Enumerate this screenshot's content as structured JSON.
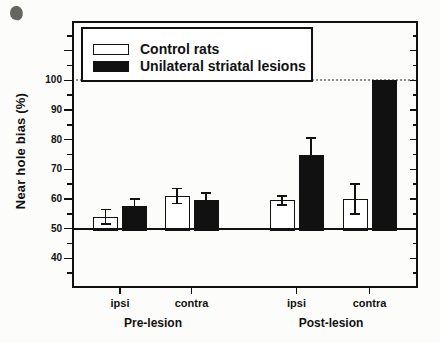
{
  "figure": {
    "background": "#fcfcfb",
    "ink": "#111111"
  },
  "chart_data": {
    "type": "bar",
    "title": "",
    "xlabel": "",
    "ylabel": "Near hole bias (%)",
    "ylim": [
      30,
      120
    ],
    "baseline": 50,
    "reference_line": {
      "value": 100,
      "style": "dotted",
      "color": "#8f8f8f"
    },
    "ytick_labels": [
      100,
      90,
      80,
      70,
      60,
      50,
      40
    ],
    "ytick_major_step": 10,
    "ytick_minor_step": 5,
    "grid": "off",
    "categories": [
      "ipsi",
      "contra",
      "ipsi",
      "contra"
    ],
    "group_labels": [
      "Pre-lesion",
      "Post-lesion"
    ],
    "legend_position": "top-left",
    "series": [
      {
        "name": "Control rats",
        "fill": "#ffffff",
        "values": [
          54,
          61,
          59.5,
          60
        ],
        "errors": [
          2.5,
          2.5,
          1.5,
          5
        ]
      },
      {
        "name": "Unilateral striatal lesions",
        "fill": "#111111",
        "values": [
          57.5,
          59.5,
          75,
          100
        ],
        "errors": [
          2.5,
          2.5,
          5.5,
          0
        ]
      }
    ]
  }
}
